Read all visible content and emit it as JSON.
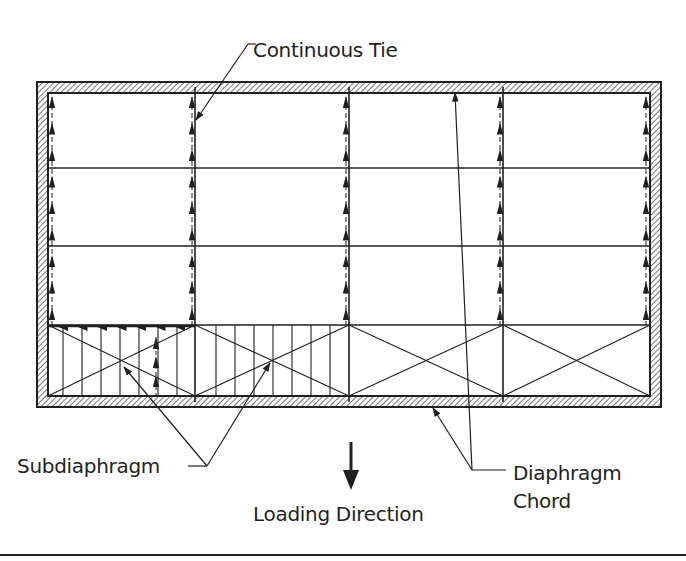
{
  "labels": {
    "continuous_tie": "Continuous Tie",
    "subdiaphragm": "Subdiaphragm",
    "diaphragm_chord_line1": "Diaphragm",
    "diaphragm_chord_line2": "Chord",
    "loading_direction": "Loading Direction"
  },
  "colors": {
    "ink": "#231f20",
    "hatch": "#555555",
    "background": "#ffffff"
  },
  "geometry": {
    "outer_wall": {
      "x1": 37,
      "y1": 82,
      "x2": 661,
      "y2": 407
    },
    "inner_wall": {
      "x1": 48,
      "y1": 93,
      "x2": 650,
      "y2": 396
    },
    "columns_x": [
      48,
      195,
      349,
      503,
      650
    ],
    "rows_y": [
      93,
      168,
      246,
      325,
      396
    ],
    "tie_arrow_columns_x": [
      52,
      192,
      346,
      500,
      646
    ],
    "subdiaphragm_bays": [
      {
        "x1": 48,
        "x2": 195,
        "joists_x": [
          63,
          82,
          101,
          120,
          139,
          158,
          177
        ]
      },
      {
        "x1": 195,
        "x2": 349,
        "joists_x": [
          216,
          235,
          254,
          273,
          292,
          311,
          330
        ]
      }
    ],
    "cross_bays": [
      [
        48,
        195
      ],
      [
        195,
        349
      ],
      [
        349,
        503
      ],
      [
        503,
        650
      ]
    ],
    "sub_tie_arrow_x": 156,
    "loading_arrow": {
      "x": 351,
      "y1": 442,
      "y2": 490
    }
  },
  "leaders": {
    "continuous_tie": {
      "from": [
        248,
        44
      ],
      "tick_to": [
        256,
        44
      ],
      "to": [
        196,
        120
      ]
    },
    "subdiaphragm": {
      "hline": [
        [
          188,
          466
        ],
        [
          207,
          466
        ]
      ],
      "targets": [
        [
          124,
          367
        ],
        [
          270,
          363
        ]
      ]
    },
    "diaphragm_chord": {
      "hline": [
        [
          472,
          470
        ],
        [
          506,
          470
        ]
      ],
      "targets": [
        [
          433,
          408
        ],
        [
          455,
          93
        ]
      ]
    }
  }
}
